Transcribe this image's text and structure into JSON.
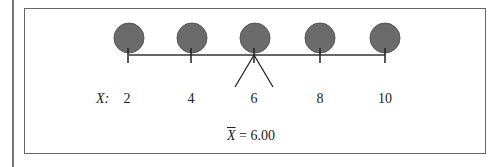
{
  "diagram": {
    "axis_label": "X:",
    "values": [
      {
        "label": "2",
        "x": 129
      },
      {
        "label": "4",
        "x": 192
      },
      {
        "label": "6",
        "x": 255
      },
      {
        "label": "8",
        "x": 320
      },
      {
        "label": "10",
        "x": 385
      }
    ],
    "mean_symbol": "X",
    "mean_text": " = 6.00",
    "colors": {
      "circle_fill": "#6b6b6b",
      "circle_stroke": "#555555",
      "line": "#333333"
    }
  }
}
